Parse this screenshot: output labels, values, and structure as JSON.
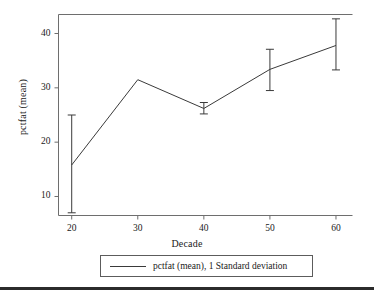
{
  "chart_data": {
    "type": "line",
    "title": "",
    "xlabel": "Decade",
    "ylabel": "pctfat (mean)",
    "x": [
      20,
      30,
      40,
      50,
      60
    ],
    "xticks": [
      "20",
      "30",
      "40",
      "50",
      "60"
    ],
    "yticks": [
      "10",
      "20",
      "30",
      "40"
    ],
    "ytick_values": [
      10,
      20,
      30,
      40
    ],
    "xlim": [
      18,
      62.5
    ],
    "ylim": [
      6.5,
      43.5
    ],
    "grid": false,
    "legend_position": "below-axis",
    "series": [
      {
        "name": "pctfat (mean), 1 Standard deviation",
        "values": [
          15.8,
          31.5,
          26.2,
          33.4,
          37.8
        ],
        "error_low": [
          7.0,
          31.5,
          25.2,
          29.5,
          33.3
        ],
        "error_high": [
          25.0,
          31.5,
          27.3,
          37.1,
          42.7
        ],
        "error_type": "1 Standard deviation",
        "color": "#3a3a3a"
      }
    ]
  },
  "axes": {
    "xlabel": "Decade",
    "ylabel": "pctfat (mean)"
  },
  "legend": {
    "entry_label": "pctfat (mean), 1 Standard deviation"
  },
  "colors": {
    "line": "#3a3a3a",
    "frame": "#6e6e6e",
    "text": "#1a1a1a",
    "rule": "#2b2b2b",
    "background": "#ffffff"
  }
}
